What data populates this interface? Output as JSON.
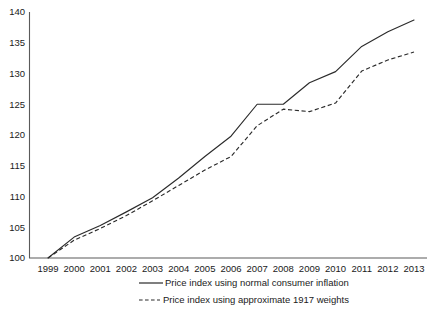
{
  "chart_data": {
    "type": "line",
    "title": "",
    "subtitle": "",
    "xlabel": "",
    "ylabel": "",
    "x": [
      1999,
      2000,
      2001,
      2002,
      2003,
      2004,
      2005,
      2006,
      2007,
      2008,
      2009,
      2010,
      2011,
      2012,
      2013
    ],
    "xtick_labels": [
      "1999",
      "2000",
      "2001",
      "2002",
      "2003",
      "2004",
      "2005",
      "2006",
      "2007",
      "2008",
      "2009",
      "2010",
      "2011",
      "2012",
      "2013"
    ],
    "ytick_labels": [
      "100",
      "105",
      "110",
      "115",
      "120",
      "125",
      "130",
      "135",
      "140"
    ],
    "yticks": [
      100,
      105,
      110,
      115,
      120,
      125,
      130,
      135,
      140
    ],
    "ylim": [
      100,
      140
    ],
    "xlim": [
      1999,
      2013
    ],
    "grid": false,
    "legend_position": "bottom-center",
    "series": [
      {
        "name": "Price index using normal consumer inflation",
        "style": "solid",
        "color": "#2b2b2b",
        "values": [
          100,
          103.4,
          105.3,
          107.5,
          109.8,
          113.0,
          116.5,
          119.8,
          125.0,
          125.0,
          128.5,
          130.3,
          134.4,
          136.8,
          138.7
        ]
      },
      {
        "name": "Price index using approximate 1917 weights",
        "style": "dashed",
        "color": "#2b2b2b",
        "values": [
          100,
          102.9,
          104.8,
          106.9,
          109.3,
          111.8,
          114.3,
          116.5,
          121.5,
          124.2,
          123.8,
          125.2,
          130.4,
          132.2,
          133.5
        ]
      }
    ],
    "annotations": []
  },
  "legend": {
    "items": [
      {
        "label": "Price index using normal consumer inflation",
        "style": "solid"
      },
      {
        "label": "Price index using approximate 1917 weights",
        "style": "dashed"
      }
    ]
  },
  "colors": {
    "line": "#2b2b2b",
    "axis": "#5a5a5a",
    "text": "#1a1a1a",
    "background": "#ffffff"
  }
}
